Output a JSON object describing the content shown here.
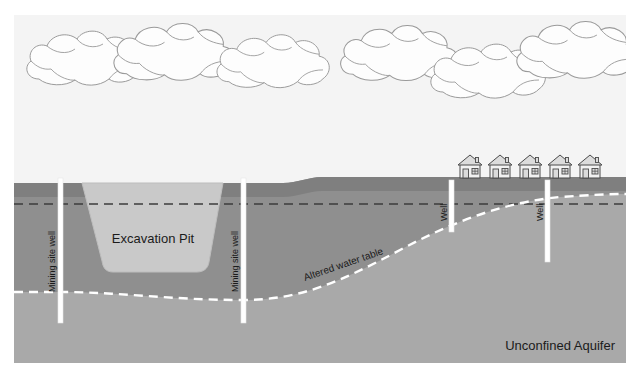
{
  "figure": {
    "background_color": "#ffffff",
    "frame": {
      "x": 14,
      "y": 15,
      "width": 612,
      "height": 348
    }
  },
  "colors": {
    "sky": "#f4f4f4",
    "cloud_fill": "#fdfdfd",
    "cloud_stroke": "#9a9a9a",
    "upper_soil": "#8f8f8f",
    "soil_top_band": "#7e7e7e",
    "aquifer": "#a9a9a9",
    "pit_fill": "#c9c9c9",
    "pit_stroke": "#b4b4b4",
    "well_fill": "#ffffff",
    "well_stroke": "#e2e2e2",
    "original_water_table": "#3a3a3a",
    "altered_water_table": "#ffffff",
    "house_wall": "#f2f2f2",
    "house_stroke": "#4a4a4a",
    "house_roof": "#d8d8d8",
    "label_text": "#1b1b1b"
  },
  "labels": {
    "excavation_pit": "Excavation Pit",
    "mining_site_well_left": "Mining site well",
    "mining_site_well_right": "Mining site well",
    "altered_water_table": "Altered water table",
    "well_left": "Well",
    "well_right": "Well",
    "unconfined_aquifer": "Unconfined Aquifer"
  },
  "clouds": [
    {
      "id": "cloud-1",
      "cx": 85,
      "cy": 63,
      "scale": 1.0
    },
    {
      "id": "cloud-2",
      "cx": 175,
      "cy": 57,
      "scale": 1.05
    },
    {
      "id": "cloud-3",
      "cx": 274,
      "cy": 66,
      "scale": 0.98
    },
    {
      "id": "cloud-4",
      "cx": 400,
      "cy": 58,
      "scale": 1.02
    },
    {
      "id": "cloud-5",
      "cx": 489,
      "cy": 76,
      "scale": 1.0
    },
    {
      "id": "cloud-6",
      "cx": 578,
      "cy": 55,
      "scale": 1.05
    }
  ],
  "houses": [
    {
      "id": "house-1",
      "x": 458,
      "y": 154
    },
    {
      "id": "house-2",
      "x": 488,
      "y": 154
    },
    {
      "id": "house-3",
      "x": 518,
      "y": 154
    },
    {
      "id": "house-4",
      "x": 548,
      "y": 154
    },
    {
      "id": "house-5",
      "x": 578,
      "y": 154
    }
  ],
  "wells": [
    {
      "id": "well-mining-left",
      "label": "Mining site well",
      "x": 60,
      "top": 178,
      "bottom": 323,
      "width": 5
    },
    {
      "id": "well-mining-right",
      "label": "Mining site well",
      "x": 243,
      "top": 178,
      "bottom": 323,
      "width": 5
    },
    {
      "id": "well-village-left",
      "label": "Well",
      "x": 451,
      "top": 180,
      "bottom": 232,
      "width": 5
    },
    {
      "id": "well-village-right",
      "label": "Well",
      "x": 547,
      "top": 180,
      "bottom": 262,
      "width": 5
    }
  ],
  "geometry": {
    "ground_level_y": 183,
    "hill_crest_y": 177,
    "hill_start_x": 283,
    "hill_end_x": 322,
    "original_water_table_y": 204,
    "pit_top_left_x": 82,
    "pit_top_right_x": 223,
    "pit_bottom_left_x": 104,
    "pit_bottom_right_x": 206,
    "pit_bottom_y": 272,
    "altered_table_left_y": 292,
    "altered_table_right_y": 198
  }
}
